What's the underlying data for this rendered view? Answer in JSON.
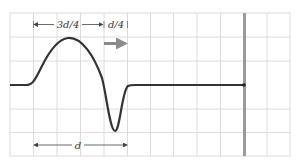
{
  "diagram": {
    "type": "wave-pulse-on-string",
    "labels": {
      "top_left_span": "3d/4",
      "top_right_span": "d/4",
      "bottom_span": "d"
    },
    "colors": {
      "grid": "#d9d9d9",
      "string": "#333333",
      "wall": "#9a9a9a",
      "direction_arrow": "#8c8c8c",
      "dimension": "#444444"
    },
    "grid": {
      "x0": 10,
      "y0": 13,
      "x1": 290,
      "y1": 156,
      "cell": 23.5
    },
    "string_y": 85,
    "wall_x": 244,
    "direction": "right"
  }
}
